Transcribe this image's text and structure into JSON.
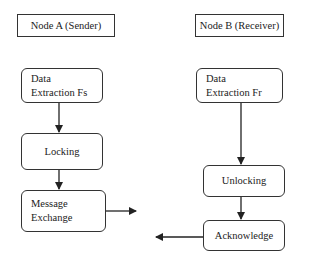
{
  "diagram": {
    "type": "flowchart",
    "columns": [
      {
        "header": "Node A (Sender)",
        "steps": [
          {
            "lines": [
              "Data",
              "Extraction Fs"
            ]
          },
          {
            "lines": [
              "Locking"
            ]
          },
          {
            "lines": [
              "Message",
              "Exchange"
            ]
          }
        ],
        "outgoing_arrow": "right"
      },
      {
        "header": "Node B (Receiver)",
        "steps": [
          {
            "lines": [
              "Data",
              "Extraction Fr"
            ]
          },
          {
            "lines": [
              "Unlocking"
            ]
          },
          {
            "lines": [
              "Acknowledge"
            ]
          }
        ],
        "outgoing_arrow": "left"
      }
    ],
    "colors": {
      "stroke": "#333333",
      "background": "#ffffff",
      "text": "#222222"
    }
  }
}
